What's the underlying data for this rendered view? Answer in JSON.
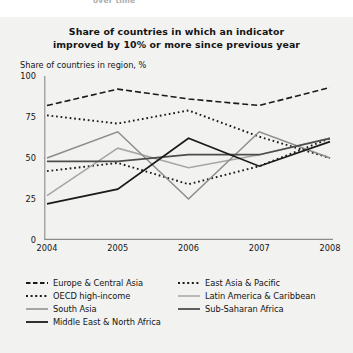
{
  "page": {
    "cut_off_text": "over time",
    "background_color": "#f2f2f0"
  },
  "title": {
    "line1": "Share of countries in which an indicator",
    "line2": "improved by 10% or more since previous year"
  },
  "chart_data": {
    "type": "line",
    "title": "Share of countries in which an indicator improved by 10% or more since previous year",
    "subtitle": "",
    "xlabel": "",
    "ylabel": "Share of countries in region, %",
    "axis_caption": "Share of countries in region, %",
    "x": [
      "2004",
      "2005",
      "2006",
      "2007",
      "2008"
    ],
    "xtick_labels": [
      "2004",
      "2005",
      "2006",
      "2007",
      "2008"
    ],
    "ytick_labels": [
      "0",
      "25",
      "50",
      "75",
      "100"
    ],
    "yticks": [
      0,
      25,
      50,
      75,
      100
    ],
    "ylim": [
      0,
      100
    ],
    "grid": false,
    "legend_position": "bottom",
    "series": [
      {
        "name": "Europe & Central Asia",
        "values": [
          82,
          92,
          86,
          82,
          93
        ],
        "style": "dash-dot",
        "color": "#1a1a1a",
        "width": 1.6
      },
      {
        "name": "East Asia & Pacific",
        "values": [
          76,
          71,
          79,
          63,
          50
        ],
        "style": "dotted",
        "color": "#1a1a1a",
        "width": 1.9
      },
      {
        "name": "OECD high-income",
        "values": [
          42,
          47,
          34,
          45,
          62
        ],
        "style": "dotted",
        "color": "#1a1a1a",
        "width": 1.9
      },
      {
        "name": "Latin America & Caribbean",
        "values": [
          27,
          56,
          44,
          52,
          62
        ],
        "style": "solid",
        "color": "#a6a6a6",
        "width": 1.5
      },
      {
        "name": "South Asia",
        "values": [
          50,
          66,
          25,
          66,
          50
        ],
        "style": "solid",
        "color": "#8c8c8c",
        "width": 1.5
      },
      {
        "name": "Sub-Saharan Africa",
        "values": [
          48,
          48,
          52,
          52,
          62
        ],
        "style": "solid",
        "color": "#4d4d4d",
        "width": 1.7
      },
      {
        "name": "Middle East & North Africa",
        "values": [
          22,
          31,
          62,
          45,
          60
        ],
        "style": "solid",
        "color": "#1a1a1a",
        "width": 1.7
      }
    ]
  },
  "legend": {
    "rows": [
      [
        {
          "label": "Europe & Central Asia",
          "style": "dash-dot",
          "color": "#1a1a1a"
        },
        {
          "label": "East Asia & Pacific",
          "style": "dotted",
          "color": "#1a1a1a"
        }
      ],
      [
        {
          "label": "OECD high-income",
          "style": "dotted",
          "color": "#1a1a1a"
        },
        {
          "label": "Latin America & Caribbean",
          "style": "solid",
          "color": "#a6a6a6"
        }
      ],
      [
        {
          "label": "South Asia",
          "style": "solid",
          "color": "#8c8c8c"
        },
        {
          "label": "Sub-Saharan Africa",
          "style": "solid",
          "color": "#4d4d4d"
        }
      ],
      [
        {
          "label": "Middle East & North Africa",
          "style": "solid",
          "color": "#1a1a1a"
        },
        {
          "label": "",
          "style": "none",
          "color": "transparent"
        }
      ]
    ]
  }
}
